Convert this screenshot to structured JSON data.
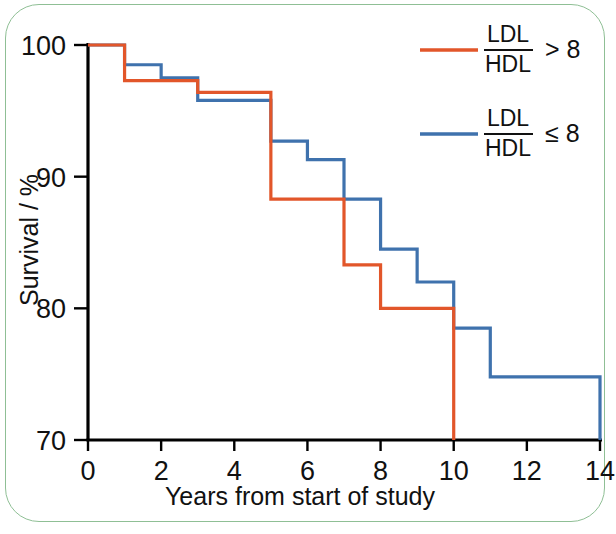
{
  "figure": {
    "border_color": "#8fbf95",
    "background": "#ffffff"
  },
  "chart_data": {
    "type": "line",
    "subtype": "kaplan-meier-step",
    "title": "",
    "subtitle": "",
    "xlabel": "Years from start of study",
    "ylabel": "Survival / %",
    "xlim": [
      0,
      14
    ],
    "ylim": [
      70,
      100
    ],
    "xticks": [
      0,
      2,
      4,
      6,
      8,
      10,
      12,
      14
    ],
    "xtick_labels": [
      "0",
      "2",
      "4",
      "6",
      "8",
      "10",
      "12",
      "14"
    ],
    "yticks": [
      70,
      80,
      90,
      100
    ],
    "ytick_labels": [
      "70",
      "80",
      "90",
      "100"
    ],
    "grid": false,
    "legend_position": "top-right",
    "series": [
      {
        "name": "LDL/HDL > 8",
        "numerator": "LDL",
        "denominator": "HDL",
        "operator": "> 8",
        "color": "#e2562a",
        "x": [
          0,
          1,
          2,
          3,
          4,
          5,
          6,
          7,
          8,
          10,
          10
        ],
        "y": [
          100,
          97.3,
          97.3,
          96.4,
          96.4,
          88.3,
          88.3,
          83.3,
          80.0,
          80.0,
          70.0
        ],
        "steps": [
          {
            "x_start": 0,
            "x_end": 1,
            "value": 100.0
          },
          {
            "x_start": 1,
            "x_end": 3,
            "value": 97.3
          },
          {
            "x_start": 3,
            "x_end": 5,
            "value": 96.4
          },
          {
            "x_start": 5,
            "x_end": 7,
            "value": 88.3
          },
          {
            "x_start": 7,
            "x_end": 8,
            "value": 83.3
          },
          {
            "x_start": 8,
            "x_end": 10,
            "value": 80.0
          },
          {
            "x_start": 10,
            "x_end": 10,
            "value": 70.0
          }
        ],
        "ends_at_x": 10,
        "drops_to_axis": true
      },
      {
        "name": "LDL/HDL ≤ 8",
        "numerator": "LDL",
        "denominator": "HDL",
        "operator": "≤ 8",
        "color": "#3f72ad",
        "x": [
          0,
          1,
          2,
          3,
          4,
          5,
          6,
          7,
          8,
          9,
          10,
          11,
          14,
          14
        ],
        "y": [
          100,
          98.5,
          97.5,
          95.8,
          95.8,
          92.7,
          91.3,
          88.3,
          84.5,
          82.0,
          78.5,
          74.8,
          74.8,
          70.0
        ],
        "steps": [
          {
            "x_start": 0,
            "x_end": 1,
            "value": 100.0
          },
          {
            "x_start": 1,
            "x_end": 2,
            "value": 98.5
          },
          {
            "x_start": 2,
            "x_end": 3,
            "value": 97.5
          },
          {
            "x_start": 3,
            "x_end": 5,
            "value": 95.8
          },
          {
            "x_start": 5,
            "x_end": 6,
            "value": 92.7
          },
          {
            "x_start": 6,
            "x_end": 7,
            "value": 91.3
          },
          {
            "x_start": 7,
            "x_end": 8,
            "value": 88.3
          },
          {
            "x_start": 8,
            "x_end": 9,
            "value": 84.5
          },
          {
            "x_start": 9,
            "x_end": 10,
            "value": 82.0
          },
          {
            "x_start": 10,
            "x_end": 11,
            "value": 78.5
          },
          {
            "x_start": 11,
            "x_end": 14,
            "value": 74.8
          },
          {
            "x_start": 14,
            "x_end": 14,
            "value": 70.0
          }
        ],
        "ends_at_x": 14,
        "drops_to_axis": true
      }
    ]
  },
  "legend": {
    "entries": [
      {
        "numerator": "LDL",
        "denominator": "HDL",
        "operator": "> 8",
        "color": "#e2562a"
      },
      {
        "numerator": "LDL",
        "denominator": "HDL",
        "operator": "≤ 8",
        "color": "#3f72ad"
      }
    ]
  },
  "axes": {
    "x_title": "Years from start of study",
    "y_title": "Survival / %",
    "axis_color": "#000000"
  }
}
